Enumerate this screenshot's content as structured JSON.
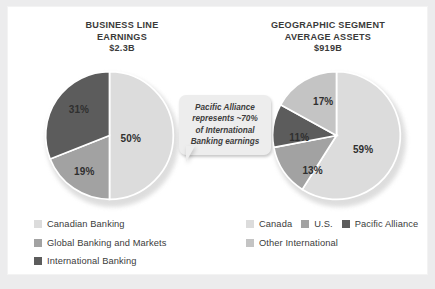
{
  "colors": {
    "background": "#ececed",
    "card": "#ffffff",
    "light_gray": "#dcdcdc",
    "mid_light_gray": "#c4c4c4",
    "mid_gray": "#a2a2a2",
    "dark_gray": "#5c5c5c",
    "text": "#3a3a3a",
    "callout_bg": "#ededed"
  },
  "left_chart": {
    "title_line1": "BUSINESS LINE",
    "title_line2": "EARNINGS",
    "amount": "$2.3B"
  },
  "right_chart": {
    "title_line1": "GEOGRAPHIC SEGMENT",
    "title_line2": "AVERAGE ASSETS",
    "amount": "$919B"
  },
  "callout": {
    "line1": "Pacific Alliance",
    "line2": "represents ~70%",
    "line3": "of International",
    "line4": "Banking earnings"
  },
  "left_legend": [
    {
      "label": "Canadian Banking",
      "color": "#dcdcdc"
    },
    {
      "label": "Global Banking and Markets",
      "color": "#a2a2a2"
    },
    {
      "label": "International Banking",
      "color": "#5c5c5c"
    }
  ],
  "right_legend_row1": [
    {
      "label": "Canada",
      "color": "#dcdcdc"
    },
    {
      "label": "U.S.",
      "color": "#a2a2a2"
    },
    {
      "label": "Pacific Alliance",
      "color": "#5c5c5c"
    }
  ],
  "right_legend_row2": [
    {
      "label": "Other International",
      "color": "#c4c4c4"
    }
  ],
  "chart_data": [
    {
      "type": "pie",
      "title": "BUSINESS LINE EARNINGS $2.3B",
      "total_label": "$2.3B",
      "categories": [
        "Canadian Banking",
        "Global Banking and Markets",
        "International Banking"
      ],
      "values": [
        50,
        19,
        31
      ],
      "value_labels": [
        "50%",
        "19%",
        "31%"
      ],
      "colors": [
        "#dcdcdc",
        "#a2a2a2",
        "#5c5c5c"
      ],
      "start_angle_deg": 0,
      "direction": "clockwise",
      "legend_position": "bottom-left",
      "grid": false
    },
    {
      "type": "pie",
      "title": "GEOGRAPHIC SEGMENT AVERAGE ASSETS $919B",
      "total_label": "$919B",
      "categories": [
        "Canada",
        "U.S.",
        "Pacific Alliance",
        "Other International"
      ],
      "values": [
        59,
        13,
        11,
        17
      ],
      "value_labels": [
        "59%",
        "13%",
        "11%",
        "17%"
      ],
      "colors": [
        "#dcdcdc",
        "#a2a2a2",
        "#5c5c5c",
        "#c4c4c4"
      ],
      "start_angle_deg": 0,
      "direction": "clockwise",
      "legend_position": "bottom-right",
      "grid": false
    }
  ]
}
